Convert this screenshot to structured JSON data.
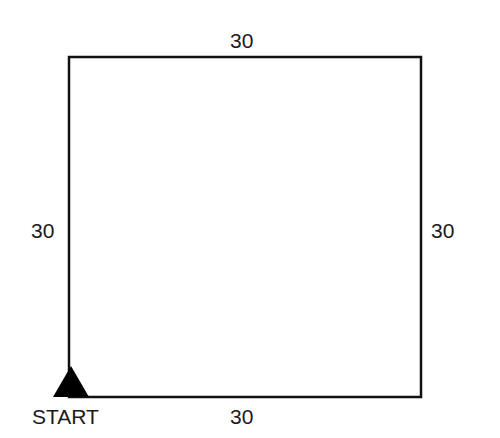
{
  "diagram": {
    "shape": "square",
    "sides": {
      "top": "30",
      "left": "30",
      "right": "30",
      "bottom": "30"
    },
    "start_label": "START",
    "colors": {
      "stroke": "#111111",
      "marker": "#000000",
      "text": "#1a1a1a"
    }
  }
}
